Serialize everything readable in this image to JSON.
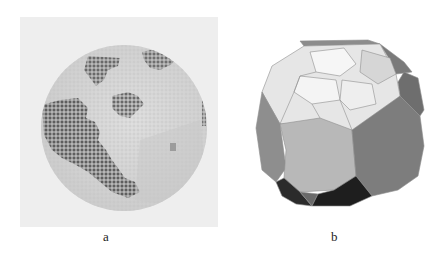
{
  "figure": {
    "panels": [
      {
        "id": "a",
        "label": "a",
        "description": "Pixelated sphere with dark grid-cell patches on a light grey background"
      },
      {
        "id": "b",
        "label": "b",
        "description": "Faceted polyhedron (truncated/Voronoi-tessellated sphere) with grey-shaded polygonal faces"
      }
    ],
    "colors": {
      "panel_a_background": "#eeeeee",
      "sphere_base": "#d2d2d2",
      "sphere_light": "#e2e2e2",
      "cell_dark": "#6a6a6a",
      "facet_white": "#f2f2f2",
      "facet_light": "#dcdcdc",
      "facet_mid": "#b5b5b5",
      "facet_dark": "#8a8a8a",
      "facet_darker": "#707070",
      "facet_black": "#2a2a2a"
    }
  }
}
